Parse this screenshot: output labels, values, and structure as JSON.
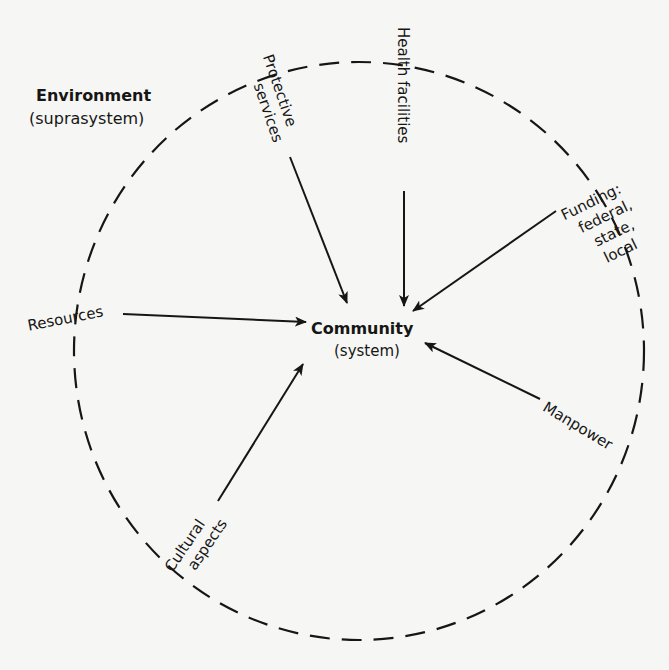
{
  "diagram": {
    "environment": {
      "label": "Environment",
      "sublabel": "(suprasystem)"
    },
    "system": {
      "label": "Community",
      "sublabel": "(system)"
    },
    "inputs": [
      {
        "id": "protective",
        "line1": "Protective",
        "line2": "services"
      },
      {
        "id": "health",
        "line1": "Health facilities"
      },
      {
        "id": "funding",
        "line1": "Funding:",
        "line2": "federal,",
        "line3": "state,",
        "line4": "local"
      },
      {
        "id": "resources",
        "line1": "Resources"
      },
      {
        "id": "manpower",
        "line1": "Manpower"
      },
      {
        "id": "cultural",
        "line1": "Cultural",
        "line2": "aspects"
      }
    ],
    "colors": {
      "background": "#f6f6f4",
      "ink": "#161616"
    },
    "boundary_style": "dashed circle"
  }
}
